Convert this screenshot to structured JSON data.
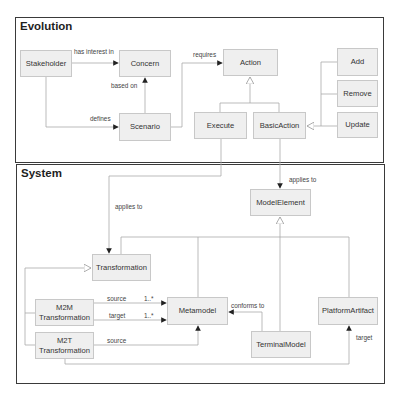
{
  "evolution": {
    "title": "Evolution",
    "nodes": {
      "stakeholder": "Stakeholder",
      "concern": "Concern",
      "action": "Action",
      "add": "Add",
      "remove": "Remove",
      "scenario": "Scenario",
      "execute": "Execute",
      "basic_action": "BasicAction",
      "update": "Update"
    },
    "edges": {
      "has_interest_in": "has interest in",
      "based_on": "based on",
      "defines": "defines",
      "requires": "requires"
    }
  },
  "system": {
    "title": "System",
    "nodes": {
      "model_element": "ModelElement",
      "transformation": "Transformation",
      "m2m_line1": "M2M",
      "m2m_line2": "Transformation",
      "m2t_line1": "M2T",
      "m2t_line2": "Transformation",
      "metamodel": "Metamodel",
      "terminal_model": "TerminalModel",
      "platform_artifact": "PlatformArtifact"
    },
    "edges": {
      "applies_to_left": "applies to",
      "applies_to_right": "applies to",
      "m2m_source": "source",
      "m2m_source_mult": "1..*",
      "m2m_target": "target",
      "m2m_target_mult": "1..*",
      "m2t_source": "source",
      "conforms_to": "conforms to",
      "m2t_target": "target"
    }
  },
  "colors": {
    "frame_border": "#3a3a3a",
    "box_fill": "#efefef",
    "box_border": "#c8c8c8",
    "line": "#aaaaaa"
  }
}
